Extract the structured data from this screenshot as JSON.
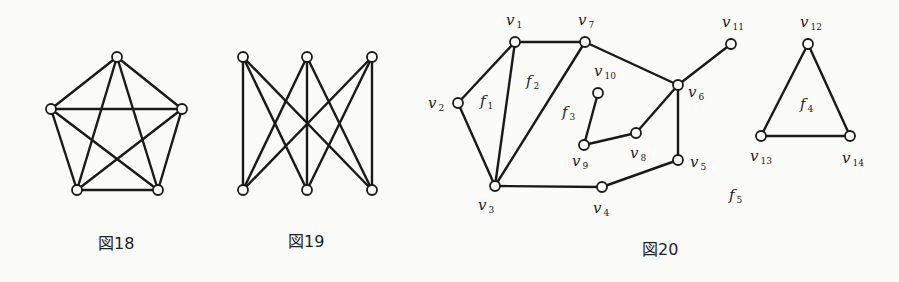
{
  "figures": [
    {
      "id": "fig18",
      "caption": "図18",
      "description": "Complete graph K5 drawn as pentagon with pentagram",
      "nodes": [
        {
          "id": "a",
          "x": 117,
          "y": 57
        },
        {
          "id": "b",
          "x": 51,
          "y": 109
        },
        {
          "id": "c",
          "x": 182,
          "y": 109
        },
        {
          "id": "d",
          "x": 77,
          "y": 190
        },
        {
          "id": "e",
          "x": 158,
          "y": 190
        }
      ],
      "edges": [
        [
          "a",
          "b"
        ],
        [
          "a",
          "c"
        ],
        [
          "a",
          "d"
        ],
        [
          "a",
          "e"
        ],
        [
          "b",
          "c"
        ],
        [
          "b",
          "d"
        ],
        [
          "b",
          "e"
        ],
        [
          "c",
          "d"
        ],
        [
          "c",
          "e"
        ],
        [
          "d",
          "e"
        ]
      ]
    },
    {
      "id": "fig19",
      "caption": "図19",
      "description": "Complete bipartite graph K3,3",
      "nodes": [
        {
          "id": "t1",
          "x": 243,
          "y": 57
        },
        {
          "id": "t2",
          "x": 307,
          "y": 57
        },
        {
          "id": "t3",
          "x": 372,
          "y": 57
        },
        {
          "id": "b1",
          "x": 243,
          "y": 190
        },
        {
          "id": "b2",
          "x": 307,
          "y": 190
        },
        {
          "id": "b3",
          "x": 372,
          "y": 190
        }
      ],
      "edges": [
        [
          "t1",
          "b1"
        ],
        [
          "t1",
          "b2"
        ],
        [
          "t1",
          "b3"
        ],
        [
          "t2",
          "b1"
        ],
        [
          "t2",
          "b2"
        ],
        [
          "t2",
          "b3"
        ],
        [
          "t3",
          "b1"
        ],
        [
          "t3",
          "b2"
        ],
        [
          "t3",
          "b3"
        ]
      ]
    },
    {
      "id": "fig20",
      "caption": "図20",
      "description": "Plane graph with vertices v1–v14 and faces f1–f5",
      "nodes": [
        {
          "id": "v1",
          "label": "v",
          "sub": "1",
          "x": 515,
          "y": 42,
          "lx": 506,
          "ly": 25
        },
        {
          "id": "v2",
          "label": "v",
          "sub": "2",
          "x": 458,
          "y": 103,
          "lx": 428,
          "ly": 108
        },
        {
          "id": "v3",
          "label": "v",
          "sub": "3",
          "x": 495,
          "y": 186,
          "lx": 478,
          "ly": 210
        },
        {
          "id": "v4",
          "label": "v",
          "sub": "4",
          "x": 602,
          "y": 187,
          "lx": 593,
          "ly": 213
        },
        {
          "id": "v5",
          "label": "v",
          "sub": "5",
          "x": 678,
          "y": 160,
          "lx": 690,
          "ly": 167
        },
        {
          "id": "v6",
          "label": "v",
          "sub": "6",
          "x": 678,
          "y": 85,
          "lx": 688,
          "ly": 97
        },
        {
          "id": "v7",
          "label": "v",
          "sub": "7",
          "x": 585,
          "y": 42,
          "lx": 578,
          "ly": 25
        },
        {
          "id": "v8",
          "label": "v",
          "sub": "8",
          "x": 636,
          "y": 133,
          "lx": 630,
          "ly": 158
        },
        {
          "id": "v9",
          "label": "v",
          "sub": "9",
          "x": 584,
          "y": 145,
          "lx": 572,
          "ly": 166
        },
        {
          "id": "v10",
          "label": "v",
          "sub": "10",
          "x": 598,
          "y": 93,
          "lx": 594,
          "ly": 76
        },
        {
          "id": "v11",
          "label": "v",
          "sub": "11",
          "x": 731,
          "y": 44,
          "lx": 722,
          "ly": 27
        },
        {
          "id": "v12",
          "label": "v",
          "sub": "12",
          "x": 808,
          "y": 44,
          "lx": 800,
          "ly": 27
        },
        {
          "id": "v13",
          "label": "v",
          "sub": "13",
          "x": 761,
          "y": 136,
          "lx": 750,
          "ly": 161
        },
        {
          "id": "v14",
          "label": "v",
          "sub": "14",
          "x": 850,
          "y": 136,
          "lx": 842,
          "ly": 163
        }
      ],
      "edges": [
        [
          "v1",
          "v7"
        ],
        [
          "v1",
          "v2"
        ],
        [
          "v1",
          "v3"
        ],
        [
          "v2",
          "v3"
        ],
        [
          "v7",
          "v3"
        ],
        [
          "v7",
          "v6"
        ],
        [
          "v6",
          "v11"
        ],
        [
          "v6",
          "v8"
        ],
        [
          "v6",
          "v5"
        ],
        [
          "v8",
          "v9"
        ],
        [
          "v9",
          "v10"
        ],
        [
          "v3",
          "v4"
        ],
        [
          "v4",
          "v5"
        ],
        [
          "v12",
          "v13"
        ],
        [
          "v12",
          "v14"
        ],
        [
          "v13",
          "v14"
        ]
      ],
      "faces": [
        {
          "label": "f",
          "sub": "1",
          "x": 480,
          "y": 106
        },
        {
          "label": "f",
          "sub": "2",
          "x": 526,
          "y": 86
        },
        {
          "label": "f",
          "sub": "3",
          "x": 562,
          "y": 117
        },
        {
          "label": "f",
          "sub": "4",
          "x": 800,
          "y": 109
        },
        {
          "label": "f",
          "sub": "5",
          "x": 729,
          "y": 200
        }
      ]
    }
  ],
  "captions": {
    "fig18": {
      "text": "図18",
      "x": 98,
      "y": 249
    },
    "fig19": {
      "text": "図19",
      "x": 288,
      "y": 247
    },
    "fig20": {
      "text": "図20",
      "x": 642,
      "y": 255
    }
  }
}
